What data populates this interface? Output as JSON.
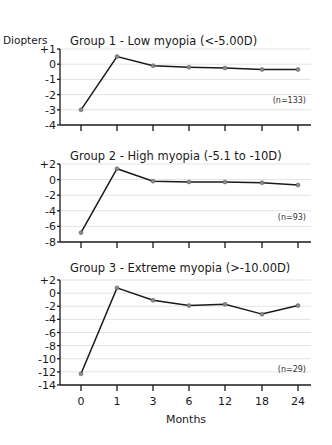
{
  "chart_data": [
    {
      "type": "line",
      "title": "Group 1 - Low myopia (<-5.00D)",
      "ylabel": "Diopters",
      "xlabel": "Months",
      "categories": [
        "0",
        "1",
        "3",
        "6",
        "12",
        "18",
        "24"
      ],
      "y_ticks": [
        "+1",
        "0",
        "-1",
        "-2",
        "-3",
        "-4"
      ],
      "y_tick_values": [
        1,
        0,
        -1,
        -2,
        -3,
        -4
      ],
      "ylim": [
        -4,
        1
      ],
      "annotation": "(n=133)",
      "grid": true,
      "series": [
        {
          "name": "Group 1",
          "values": [
            -3.0,
            0.5,
            -0.1,
            -0.2,
            -0.25,
            -0.35,
            -0.35
          ]
        }
      ]
    },
    {
      "type": "line",
      "title": "Group 2 - High myopia (-5.1 to -10D)",
      "ylabel": "Diopters",
      "xlabel": "Months",
      "categories": [
        "0",
        "1",
        "3",
        "6",
        "12",
        "18",
        "24"
      ],
      "y_ticks": [
        "+2",
        "0",
        "-2",
        "-4",
        "-6",
        "-8"
      ],
      "y_tick_values": [
        2,
        0,
        -2,
        -4,
        -6,
        -8
      ],
      "ylim": [
        -8,
        2
      ],
      "annotation": "(n=93)",
      "grid": true,
      "series": [
        {
          "name": "Group 2",
          "values": [
            -6.8,
            1.4,
            -0.2,
            -0.3,
            -0.3,
            -0.4,
            -0.7
          ]
        }
      ]
    },
    {
      "type": "line",
      "title": "Group 3 - Extreme myopia (>-10.00D)",
      "ylabel": "Diopters",
      "xlabel": "Months",
      "categories": [
        "0",
        "1",
        "3",
        "6",
        "12",
        "18",
        "24"
      ],
      "y_ticks": [
        "+2",
        "0",
        "-2",
        "-4",
        "-6",
        "-8",
        "-10",
        "-12",
        "-14"
      ],
      "y_tick_values": [
        2,
        0,
        -2,
        -4,
        -6,
        -8,
        -10,
        -12,
        -14
      ],
      "ylim": [
        -14,
        2
      ],
      "annotation": "(n=29)",
      "grid": true,
      "series": [
        {
          "name": "Group 3",
          "values": [
            -12.3,
            0.8,
            -1.1,
            -1.9,
            -1.7,
            -3.2,
            -1.9
          ]
        }
      ]
    }
  ],
  "labels": {
    "y_axis": "Diopters",
    "x_axis": "Months"
  }
}
